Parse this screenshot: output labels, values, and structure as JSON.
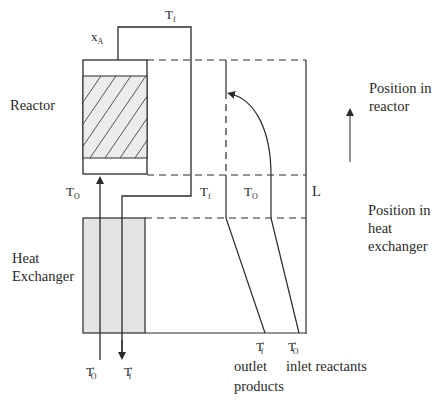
{
  "diagram": {
    "type": "reactor-heat-exchanger-temperature-profile",
    "labels": {
      "reactor": "Reactor",
      "heat_exchanger_line1": "Heat",
      "heat_exchanger_line2": "Exchanger",
      "conversion": "x",
      "conversion_sub": "A",
      "tf_top": "T",
      "tf_top_sub": "f",
      "to_left": "T",
      "to_left_sub": "O",
      "tf_mid": "T",
      "tf_mid_sub": "f",
      "to_mid": "T",
      "to_mid_sub": "O",
      "length": "L",
      "to_prime_bottom": "T",
      "to_prime_bottom_sub": "O",
      "tf_prime_bottom": "T",
      "tf_prime_bottom_sub": "f",
      "tf_prime_right": "T",
      "tf_prime_right_sub": "f",
      "to_prime_right": "T",
      "to_prime_right_sub": "O",
      "prime_mark": "′",
      "outlet": "outlet",
      "products": "products",
      "inlet_reactants": "inlet reactants",
      "position_reactor_line1": "Position in",
      "position_reactor_line2": "reactor",
      "position_hx_line1": "Position in",
      "position_hx_line2": "heat",
      "position_hx_line3": "exchanger"
    },
    "colors": {
      "line": "#2a2a2a",
      "hx_fill": "#e4e4e4",
      "reactor_fill": "#ececec"
    }
  }
}
